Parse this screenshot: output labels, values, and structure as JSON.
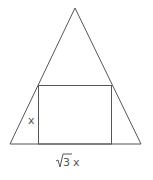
{
  "diagram": {
    "type": "geometry",
    "stroke_color": "#555555",
    "labels": {
      "height": "x",
      "width_radical": "√",
      "width_radicand": "3",
      "width_var": "x"
    }
  }
}
